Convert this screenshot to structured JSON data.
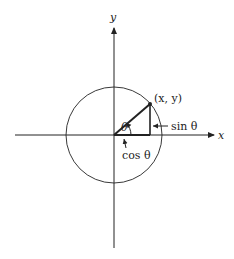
{
  "diagram": {
    "type": "unit-circle",
    "axes": {
      "x_label": "x",
      "y_label": "y"
    },
    "point_label": "(x, y)",
    "angle_label": "θ",
    "sin_label": "sin θ",
    "cos_label": "cos θ",
    "colors": {
      "stroke": "#222222",
      "background": "#ffffff"
    }
  }
}
